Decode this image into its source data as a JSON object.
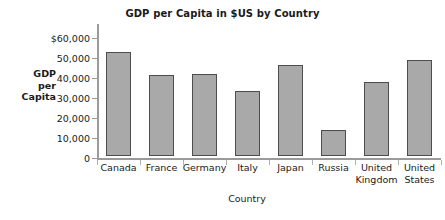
{
  "chart_data": {
    "type": "bar",
    "title": "GDP per Capita in $US by Country",
    "xlabel": "Country",
    "ylabel": "GDP per Capita",
    "ylabel_lines": [
      "GDP",
      "per",
      "Capita"
    ],
    "categories": [
      "Canada",
      "France",
      "Germany",
      "Italy",
      "Japan",
      "Russia",
      "United Kingdom",
      "United States"
    ],
    "category_lines": [
      [
        "Canada"
      ],
      [
        "France"
      ],
      [
        "Germany"
      ],
      [
        "Italy"
      ],
      [
        "Japan"
      ],
      [
        "Russia"
      ],
      [
        "United",
        "Kingdom"
      ],
      [
        "United",
        "States"
      ]
    ],
    "values": [
      52000,
      40700,
      41000,
      32300,
      45500,
      13200,
      37200,
      48200
    ],
    "ylim": [
      0,
      60000
    ],
    "ytick_values": [
      60000,
      50000,
      40000,
      30000,
      20000,
      10000,
      0
    ],
    "ytick_labels": [
      "$60,000",
      "50,000",
      "40,000",
      "30,000",
      "20,000",
      "10,000",
      "0"
    ],
    "grid": false,
    "legend": false,
    "bar_color": "#a9a9a9",
    "bar_border_color": "#4d4d4d",
    "axis_color": "#9a9a9a",
    "background_color": "#ffffff"
  }
}
